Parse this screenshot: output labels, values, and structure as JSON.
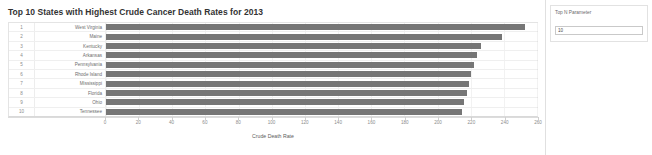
{
  "viz": {
    "title": "Top 10 States with Highest Crude Cancer Death Rates for 2013"
  },
  "parameter_panel": {
    "label": "Top N Parameter",
    "value": "10",
    "placeholder": "10"
  },
  "axis": {
    "title": "Crude Death Rate",
    "ticks": [
      "0",
      "20",
      "40",
      "60",
      "80",
      "100",
      "120",
      "140",
      "160",
      "180",
      "200",
      "220",
      "240",
      "260"
    ]
  },
  "colors": {
    "bar": "#767676",
    "grid": "#efefef",
    "text": "#6e6e6e"
  },
  "chart_data": {
    "type": "bar",
    "orientation": "horizontal",
    "title": "Top 10 States with Highest Crude Cancer Death Rates for 2013",
    "xlabel": "Crude Death Rate",
    "ylabel": "",
    "xlim": [
      0,
      260
    ],
    "xticks": [
      0,
      20,
      40,
      60,
      80,
      100,
      120,
      140,
      160,
      180,
      200,
      220,
      240,
      260
    ],
    "grid": true,
    "legend": "none",
    "categories": [
      "West Virginia",
      "Maine",
      "Kentucky",
      "Arkansas",
      "Pennsylvania",
      "Rhode Island",
      "Mississippi",
      "Florida",
      "Ohio",
      "Tennessee"
    ],
    "values": [
      253,
      239,
      226,
      224,
      222,
      220,
      219,
      218,
      216,
      215
    ],
    "ranks": [
      "1",
      "2",
      "3",
      "4",
      "5",
      "6",
      "7",
      "8",
      "9",
      "10"
    ]
  }
}
